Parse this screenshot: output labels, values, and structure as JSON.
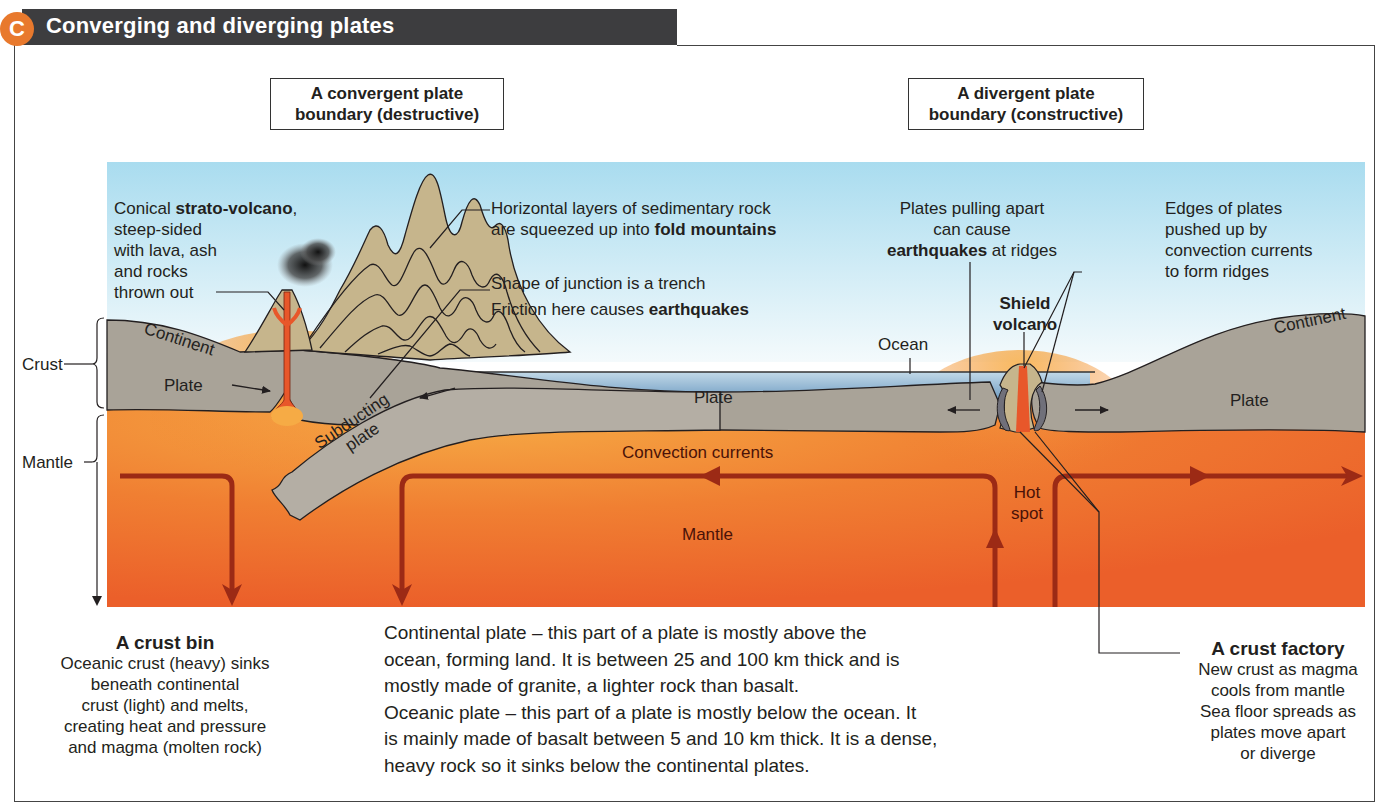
{
  "header": {
    "badge": "C",
    "title": "Converging and diverging plates",
    "badge_color": "#e8792d",
    "bar_color": "#3d3d3f"
  },
  "boxes": {
    "convergent": {
      "line1": "A convergent plate",
      "line2": "boundary (destructive)"
    },
    "divergent": {
      "line1": "A divergent plate",
      "line2": "boundary (constructive)"
    }
  },
  "colors": {
    "sky_top": "#a9dcef",
    "sky_bottom": "#f4fafc",
    "crust": "#a9a398",
    "mountain": "#c6b58c",
    "mantle_hot": "#f4a23a",
    "mantle": "#ee6a2a",
    "ocean": "#7fa8c8",
    "current_arrow": "#9c2a15",
    "magma": "#e8572a"
  },
  "side_labels": {
    "crust": "Crust",
    "mantle": "Mantle"
  },
  "annotations": {
    "strato": {
      "line1_pre": "Conical ",
      "line1_bold": "strato-volcano",
      "line1_post": ",",
      "line2": "steep-sided",
      "line3": "with  lava, ash",
      "line4": "and rocks",
      "line5": "thrown out"
    },
    "fold": {
      "line1": "Horizontal layers of sedimentary rock",
      "line2_pre": "are squeezed up into ",
      "line2_bold": "fold mountains"
    },
    "trench": {
      "line1": "Shape of junction is a trench",
      "line2_pre": "Friction here causes ",
      "line2_bold": "earthquakes"
    },
    "pulling": {
      "line1": "Plates pulling apart",
      "line2": "can cause",
      "line3_bold": "earthquakes",
      "line3_post": " at ridges"
    },
    "edges": {
      "line1": "Edges of plates",
      "line2": "pushed up by",
      "line3": "convection currents",
      "line4": "to form ridges"
    },
    "shield": {
      "line1": "Shield",
      "line2": "volcano"
    },
    "ocean": "Ocean",
    "continent_left": "Continent",
    "continent_right": "Continent",
    "plate_left": "Plate",
    "plate_mid": "Plate",
    "plate_right": "Plate",
    "subducting_1": "Subducting",
    "subducting_2": "plate",
    "convection": "Convection currents",
    "mantle": "Mantle",
    "hotspot_1": "Hot",
    "hotspot_2": "spot"
  },
  "crust_bin": {
    "title": "A crust bin",
    "lines": [
      "Oceanic crust (heavy)  sinks",
      "beneath continental",
      "crust (light) and melts,",
      "creating heat and  pressure",
      "and magma (molten rock)"
    ]
  },
  "crust_factory": {
    "title": "A crust factory",
    "lines": [
      "New crust as magma",
      "cools from mantle",
      "Sea floor spreads as",
      "plates move apart",
      "or diverge"
    ]
  },
  "body_text": {
    "lines": [
      "Continental plate – this part of a plate is mostly above the",
      "ocean, forming land. It is between 25 and 100 km thick and is",
      "mostly made of granite, a lighter rock than basalt.",
      "Oceanic plate – this part of a plate is mostly below the ocean. It",
      "is mainly made of basalt between 5 and 10 km thick. It is a dense,",
      "heavy rock so it sinks below the continental plates."
    ]
  }
}
